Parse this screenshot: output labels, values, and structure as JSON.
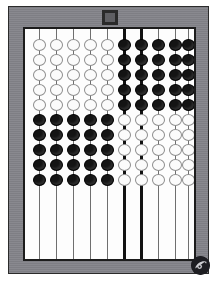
{
  "image": {
    "subject": "abacus",
    "alt_text": "Wooden-framed abacus with ten vertical rods and ten beads per rod",
    "orientation": "portrait"
  },
  "colors": {
    "frame": "#84848a",
    "frame_rim": "#2b2b2b",
    "board": "#fdfdfd",
    "board_border": "#1c1c1c",
    "rod_thin": "#6f6f6f",
    "rod_thick": "#121212",
    "bead_white_fill": "#fbfbfb",
    "bead_white_outline": "#8d8d8d",
    "bead_black_fill": "#141414",
    "knob": "#5f5f63",
    "logo": "#1e1e22"
  },
  "frame": {
    "knob_name": "top-center-knob",
    "logo_name": "watermark-logo"
  },
  "abacus": {
    "rod_count": 10,
    "beads_per_rod": 10,
    "bead_rows": 10,
    "thick_rod_indexes": [
      5,
      6
    ],
    "rod_x": [
      13,
      30,
      47,
      64,
      81,
      98,
      115,
      132,
      149,
      162
    ],
    "bead_row_y": [
      10,
      25,
      40,
      55,
      70,
      85,
      100,
      115,
      130,
      145
    ],
    "rods": [
      {
        "index": 0,
        "label": "rod-1",
        "thick": false,
        "top_group_color": "white",
        "top_group_count": 5,
        "bottom_group_color": "black",
        "bottom_group_count": 5,
        "beads": [
          "white",
          "white",
          "white",
          "white",
          "white",
          "black",
          "black",
          "black",
          "black",
          "black"
        ]
      },
      {
        "index": 1,
        "label": "rod-2",
        "thick": false,
        "top_group_color": "white",
        "top_group_count": 5,
        "bottom_group_color": "black",
        "bottom_group_count": 5,
        "beads": [
          "white",
          "white",
          "white",
          "white",
          "white",
          "black",
          "black",
          "black",
          "black",
          "black"
        ]
      },
      {
        "index": 2,
        "label": "rod-3",
        "thick": false,
        "top_group_color": "white",
        "top_group_count": 5,
        "bottom_group_color": "black",
        "bottom_group_count": 5,
        "beads": [
          "white",
          "white",
          "white",
          "white",
          "white",
          "black",
          "black",
          "black",
          "black",
          "black"
        ]
      },
      {
        "index": 3,
        "label": "rod-4",
        "thick": false,
        "top_group_color": "white",
        "top_group_count": 5,
        "bottom_group_color": "black",
        "bottom_group_count": 5,
        "beads": [
          "white",
          "white",
          "white",
          "white",
          "white",
          "black",
          "black",
          "black",
          "black",
          "black"
        ]
      },
      {
        "index": 4,
        "label": "rod-5",
        "thick": false,
        "top_group_color": "white",
        "top_group_count": 5,
        "bottom_group_color": "black",
        "bottom_group_count": 5,
        "beads": [
          "white",
          "white",
          "white",
          "white",
          "white",
          "black",
          "black",
          "black",
          "black",
          "black"
        ]
      },
      {
        "index": 5,
        "label": "rod-6",
        "thick": true,
        "top_group_color": "black",
        "top_group_count": 5,
        "bottom_group_color": "white",
        "bottom_group_count": 5,
        "beads": [
          "black",
          "black",
          "black",
          "black",
          "black",
          "white",
          "white",
          "white",
          "white",
          "white"
        ]
      },
      {
        "index": 6,
        "label": "rod-7",
        "thick": true,
        "top_group_color": "black",
        "top_group_count": 5,
        "bottom_group_color": "white",
        "bottom_group_count": 5,
        "beads": [
          "black",
          "black",
          "black",
          "black",
          "black",
          "white",
          "white",
          "white",
          "white",
          "white"
        ]
      },
      {
        "index": 7,
        "label": "rod-8",
        "thick": false,
        "top_group_color": "black",
        "top_group_count": 5,
        "bottom_group_color": "white",
        "bottom_group_count": 5,
        "beads": [
          "black",
          "black",
          "black",
          "black",
          "black",
          "white",
          "white",
          "white",
          "white",
          "white"
        ]
      },
      {
        "index": 8,
        "label": "rod-9",
        "thick": false,
        "top_group_color": "black",
        "top_group_count": 5,
        "bottom_group_color": "white",
        "bottom_group_count": 5,
        "beads": [
          "black",
          "black",
          "black",
          "black",
          "black",
          "white",
          "white",
          "white",
          "white",
          "white"
        ]
      },
      {
        "index": 9,
        "label": "rod-10",
        "thick": false,
        "top_group_color": "black",
        "top_group_count": 5,
        "bottom_group_color": "white",
        "bottom_group_count": 5,
        "beads": [
          "black",
          "black",
          "black",
          "black",
          "black",
          "white",
          "white",
          "white",
          "white",
          "white"
        ]
      }
    ]
  }
}
